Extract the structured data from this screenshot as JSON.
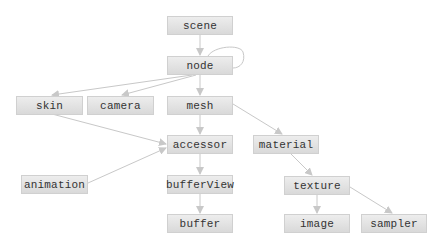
{
  "diagram": {
    "colors": {
      "node_fill_top": "#ededed",
      "node_fill_bottom": "#d9d9d9",
      "edge": "#c8c8c8",
      "text": "#333333"
    },
    "nodes": [
      {
        "id": "scene",
        "label": "scene"
      },
      {
        "id": "node",
        "label": "node"
      },
      {
        "id": "skin",
        "label": "skin"
      },
      {
        "id": "camera",
        "label": "camera"
      },
      {
        "id": "mesh",
        "label": "mesh"
      },
      {
        "id": "accessor",
        "label": "accessor"
      },
      {
        "id": "material",
        "label": "material"
      },
      {
        "id": "animation",
        "label": "animation"
      },
      {
        "id": "bufferView",
        "label": "bufferView"
      },
      {
        "id": "texture",
        "label": "texture"
      },
      {
        "id": "buffer",
        "label": "buffer"
      },
      {
        "id": "image",
        "label": "image"
      },
      {
        "id": "sampler",
        "label": "sampler"
      }
    ],
    "edges": [
      {
        "from": "scene",
        "to": "node"
      },
      {
        "from": "node",
        "to": "node"
      },
      {
        "from": "node",
        "to": "skin"
      },
      {
        "from": "node",
        "to": "camera"
      },
      {
        "from": "node",
        "to": "mesh"
      },
      {
        "from": "skin",
        "to": "accessor"
      },
      {
        "from": "mesh",
        "to": "accessor"
      },
      {
        "from": "mesh",
        "to": "material"
      },
      {
        "from": "animation",
        "to": "accessor"
      },
      {
        "from": "accessor",
        "to": "bufferView"
      },
      {
        "from": "bufferView",
        "to": "buffer"
      },
      {
        "from": "material",
        "to": "texture"
      },
      {
        "from": "texture",
        "to": "image"
      },
      {
        "from": "texture",
        "to": "sampler"
      }
    ]
  }
}
